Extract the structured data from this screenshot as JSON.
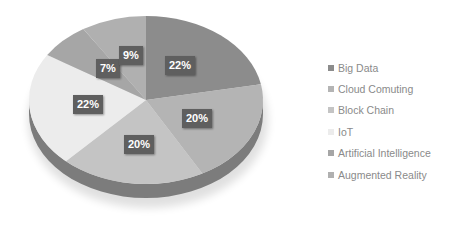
{
  "chart_data": {
    "type": "pie",
    "title": "",
    "style": "3d",
    "categories": [
      "Big Data",
      "Cloud Comuting",
      "Block Chain",
      "IoT",
      "Artificial Intelligence",
      "Augmented Reality"
    ],
    "values": [
      22,
      20,
      20,
      22,
      7,
      9
    ],
    "labels": [
      "22%",
      "20%",
      "20%",
      "22%",
      "7%",
      "9%"
    ],
    "colors": [
      "#8c8c8c",
      "#b4b4b4",
      "#c4c4c4",
      "#ececec",
      "#a6a6a6",
      "#b0b0b0"
    ],
    "legend_position": "right"
  },
  "legend": {
    "items": [
      {
        "label": "Big Data",
        "color": "#8c8c8c"
      },
      {
        "label": "Cloud Comuting",
        "color": "#b4b4b4"
      },
      {
        "label": "Block Chain",
        "color": "#c4c4c4"
      },
      {
        "label": "IoT",
        "color": "#ececec"
      },
      {
        "label": "Artificial Intelligence",
        "color": "#a6a6a6"
      },
      {
        "label": "Augmented Reality",
        "color": "#b0b0b0"
      }
    ]
  },
  "data_labels": {
    "big_data": "22%",
    "cloud": "20%",
    "block_chain": "20%",
    "iot": "22%",
    "ai": "7%",
    "ar": "9%"
  }
}
